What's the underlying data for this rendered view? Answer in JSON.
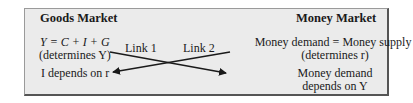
{
  "goods_market": {
    "title": "Goods Market",
    "equation": "Y = C + I + G",
    "equation_note": "(determines Y)",
    "dependency": "I depends on r"
  },
  "money_market": {
    "title": "Money Market",
    "equation": "Money demand = Money supply",
    "equation_note": "(determines r)",
    "dependency_line1": "Money demand",
    "dependency_line2": "depends on Y"
  },
  "links": [
    {
      "label": "Link 1",
      "from": "Goods Market: (determines Y)",
      "to": "Money Market: Money demand depends on Y"
    },
    {
      "label": "Link 2",
      "from": "Money Market: (determines r)",
      "to": "Goods Market: I depends on r"
    }
  ],
  "colors": {
    "box_bg": "#ebebeb",
    "border": "#555555",
    "text": "#1a1a1a"
  }
}
